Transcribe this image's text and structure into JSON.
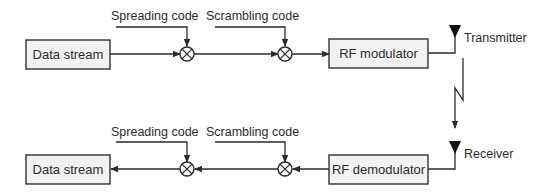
{
  "transmitter_chain": {
    "source_block": {
      "label": "Data stream"
    },
    "spreading_code": {
      "label": "Spreading code"
    },
    "scrambling_code": {
      "label": "Scrambling code"
    },
    "modulator_block": {
      "label": "RF modulator"
    },
    "antenna": {
      "label": "Transmitter"
    }
  },
  "receiver_chain": {
    "sink_block": {
      "label": "Data stream"
    },
    "spreading_code": {
      "label": "Spreading code"
    },
    "scrambling_code": {
      "label": "Scrambling code"
    },
    "demodulator_block": {
      "label": "RF demodulator"
    },
    "antenna": {
      "label": "Receiver"
    }
  },
  "wireless_link": {
    "icon": "lightning-zigzag"
  },
  "mixer_symbol": "⊗",
  "colors": {
    "line": "#2b2b2b",
    "box_fill": "#f2f2f2",
    "box_stroke": "#333333",
    "antenna": "#111111"
  }
}
